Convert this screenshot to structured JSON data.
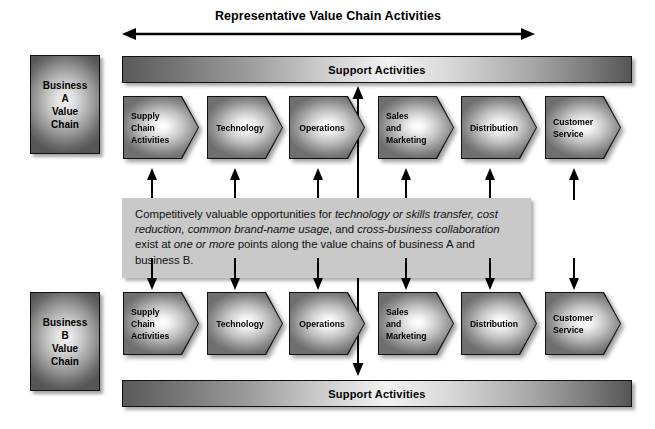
{
  "diagram": {
    "title": "Representative Value Chain Activities",
    "top_range_arrow": "horizontal-double-arrow",
    "vertical_link_arrow": "vertical-double-arrow",
    "support_bar_label": "Support Activities",
    "colors": {
      "panel_fill": "#c9c9c9",
      "shape_dark": "#565656",
      "shape_light": "#ffffff",
      "outline": "#111111",
      "text": "#000000"
    },
    "business_a": {
      "label": "Business\nA\nValue\nChain",
      "lines": [
        "Business",
        "A",
        "Value",
        "Chain"
      ]
    },
    "business_b": {
      "label": "Business\nB\nValue\nChain",
      "lines": [
        "Business",
        "B",
        "Value",
        "Chain"
      ]
    },
    "support_top": {
      "label": "Support Activities"
    },
    "support_bottom": {
      "label": "Support Activities"
    },
    "activities_a": [
      {
        "lines": [
          "Supply",
          "Chain",
          "Activities"
        ],
        "align": "left"
      },
      {
        "lines": [
          "Technology"
        ],
        "align": "center"
      },
      {
        "lines": [
          "Operations"
        ],
        "align": "center"
      },
      {
        "lines": [
          "Sales",
          "and",
          "Marketing"
        ],
        "align": "left"
      },
      {
        "lines": [
          "Distribution"
        ],
        "align": "center"
      },
      {
        "lines": [
          "Customer",
          "Service"
        ],
        "align": "left"
      }
    ],
    "activities_b": [
      {
        "lines": [
          "Supply",
          "Chain",
          "Activities"
        ],
        "align": "left"
      },
      {
        "lines": [
          "Technology"
        ],
        "align": "center"
      },
      {
        "lines": [
          "Operations"
        ],
        "align": "center"
      },
      {
        "lines": [
          "Sales",
          "and",
          "Marketing"
        ],
        "align": "left"
      },
      {
        "lines": [
          "Distribution"
        ],
        "align": "center"
      },
      {
        "lines": [
          "Customer",
          "Service"
        ],
        "align": "left"
      }
    ],
    "panel": {
      "segments": [
        {
          "text": "Competitively valuable opportunities for ",
          "italic": false
        },
        {
          "text": "technology or skills transfer, cost reduction, common brand-name usage",
          "italic": true
        },
        {
          "text": ", and ",
          "italic": false
        },
        {
          "text": "cross-business collaboration",
          "italic": true
        },
        {
          "text": " exist at ",
          "italic": false
        },
        {
          "text": "one or more",
          "italic": true
        },
        {
          "text": " points along the value chains of business A and business B.",
          "italic": false
        }
      ],
      "plain_text": "Competitively valuable opportunities for technology or skills transfer, cost reduction, common brand-name usage, and cross-business collaboration exist at one or more points along the value chains of business A and business B."
    },
    "connector_arrows_up": 6,
    "connector_arrows_down": 6
  }
}
